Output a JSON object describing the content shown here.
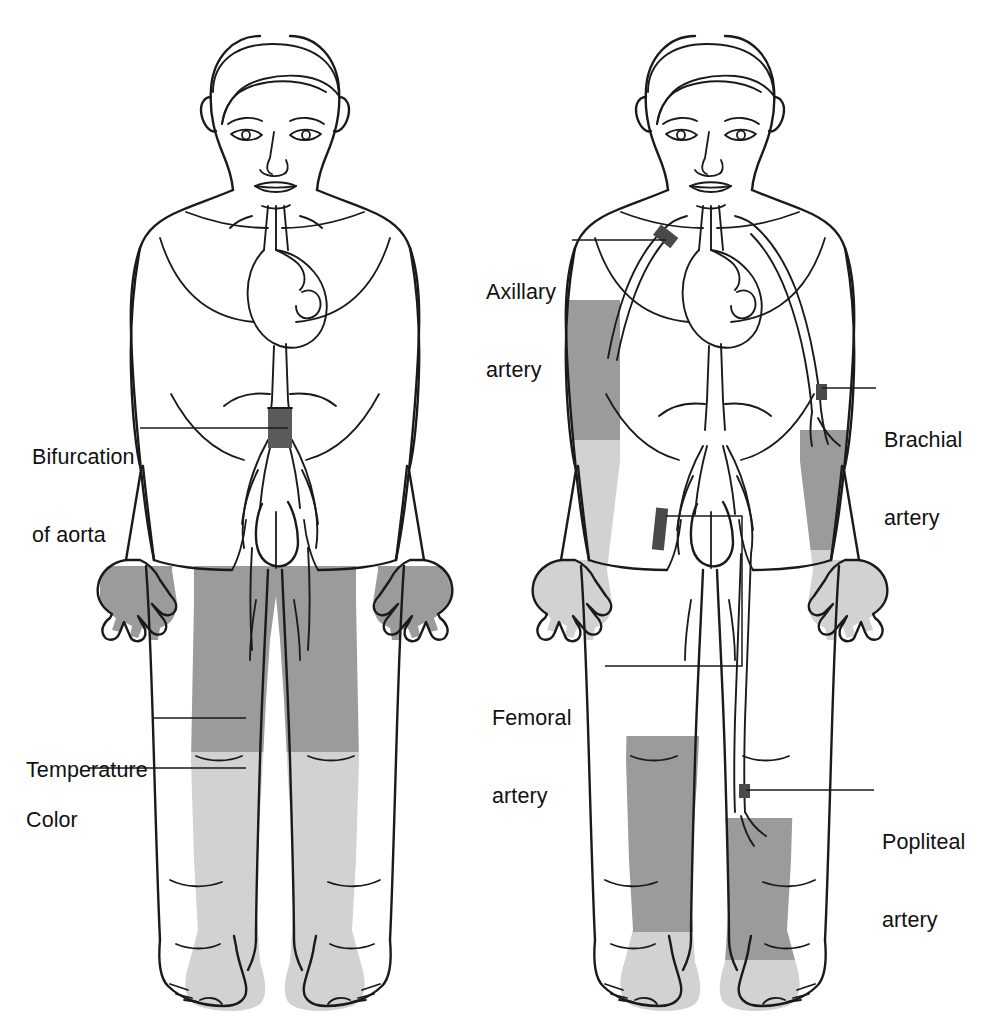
{
  "figure": {
    "colors": {
      "outline": "#1a1a1a",
      "shade_dark": "#9b9b9b",
      "shade_light": "#d2d2d2",
      "marker_dark": "#4a4a4a",
      "background": "#ffffff"
    }
  },
  "left_figure": {
    "name": "assessment-figure",
    "labels": [
      {
        "id": "bifurcation-of-aorta",
        "line1": "Bifurcation",
        "line2": "of aorta"
      },
      {
        "id": "temperature",
        "line1": "Temperature",
        "line2": ""
      },
      {
        "id": "color",
        "line1": "Color",
        "line2": ""
      }
    ],
    "shaded_regions": [
      {
        "id": "thighs",
        "tone": "dark",
        "meaning": "Temperature"
      },
      {
        "id": "lower-legs-and-feet",
        "tone": "light",
        "meaning": "Color"
      },
      {
        "id": "aortic-bifurcation-marker",
        "tone": "marker",
        "meaning": "Bifurcation of aorta"
      }
    ]
  },
  "right_figure": {
    "name": "arterial-sites-figure",
    "labels": [
      {
        "id": "axillary-artery",
        "line1": "Axillary",
        "line2": "artery"
      },
      {
        "id": "brachial-artery",
        "line1": "Brachial",
        "line2": "artery"
      },
      {
        "id": "femoral-artery",
        "line1": "Femoral",
        "line2": "artery"
      },
      {
        "id": "popliteal-artery",
        "line1": "Popliteal",
        "line2": "artery"
      }
    ],
    "shaded_regions": [
      {
        "id": "right-upper-arm",
        "tone": "dark"
      },
      {
        "id": "right-forearm-and-hand",
        "tone": "light"
      },
      {
        "id": "left-forearm",
        "tone": "dark"
      },
      {
        "id": "left-hand",
        "tone": "light"
      },
      {
        "id": "right-calf",
        "tone": "dark"
      },
      {
        "id": "right-foot",
        "tone": "light"
      },
      {
        "id": "left-calf",
        "tone": "dark"
      },
      {
        "id": "left-foot",
        "tone": "light"
      }
    ],
    "artery_markers": [
      {
        "id": "axillary-marker",
        "tone": "marker"
      },
      {
        "id": "brachial-marker",
        "tone": "marker"
      },
      {
        "id": "femoral-marker",
        "tone": "marker"
      },
      {
        "id": "popliteal-marker",
        "tone": "marker"
      }
    ]
  }
}
